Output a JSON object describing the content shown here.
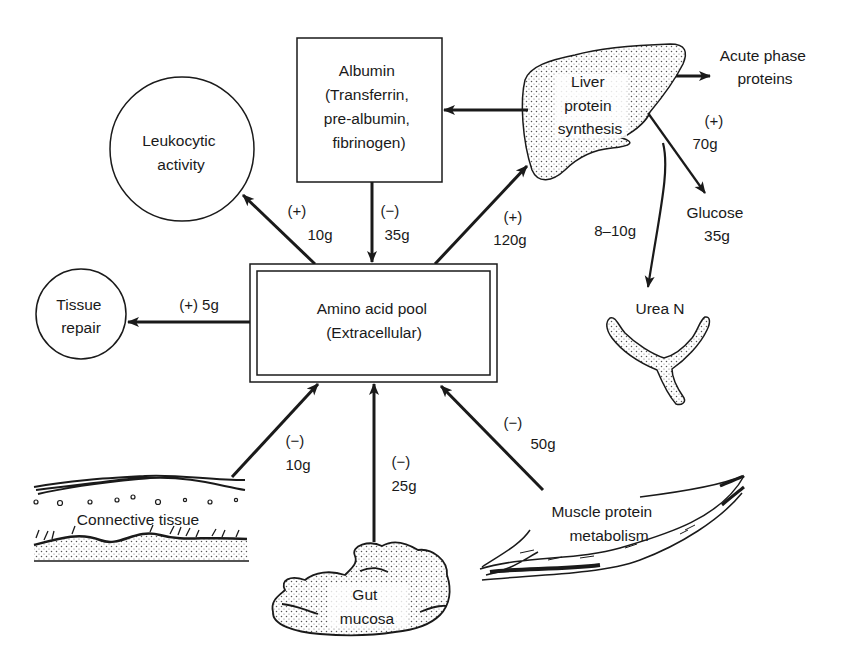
{
  "diagram": {
    "type": "protein metabolism flow diagram",
    "nodes": {
      "albumin": {
        "lines": [
          "Albumin",
          "(Transferrin,",
          "pre-albumin,",
          "fibrinogen)"
        ]
      },
      "liver": {
        "lines": [
          "Liver",
          "protein",
          "synthesis"
        ]
      },
      "acute_phase": {
        "lines": [
          "Acute phase",
          "proteins"
        ]
      },
      "leukocytic": {
        "lines": [
          "Leukocytic",
          "activity"
        ]
      },
      "tissue_repair": {
        "lines": [
          "Tissue",
          "repair"
        ]
      },
      "amino_pool": {
        "lines": [
          "Amino acid pool",
          "(Extracellular)"
        ]
      },
      "glucose": {
        "lines": [
          "Glucose",
          "35g"
        ]
      },
      "urea": {
        "lines": [
          "Urea N"
        ]
      },
      "connective": {
        "lines": [
          "Connective tissue"
        ]
      },
      "gut": {
        "lines": [
          "Gut",
          "mucosa"
        ]
      },
      "muscle": {
        "lines": [
          "Muscle protein",
          "metabolism"
        ]
      }
    },
    "flows": {
      "pool_to_leukocytic": {
        "sign": "(+)",
        "amount": "10g"
      },
      "albumin_to_pool": {
        "sign": "(−)",
        "amount": "35g"
      },
      "pool_to_liver": {
        "sign": "(+)",
        "amount": "120g"
      },
      "pool_to_tissue_repair": {
        "label": "(+) 5g"
      },
      "liver_to_glucose": {
        "sign": "(+)",
        "amount": "70g"
      },
      "liver_to_urea": {
        "amount": "8–10g"
      },
      "connective_to_pool": {
        "sign": "(−)",
        "amount": "10g"
      },
      "gut_to_pool": {
        "sign": "(−)",
        "amount": "25g"
      },
      "muscle_to_pool": {
        "sign": "(−)",
        "amount": "50g"
      }
    }
  },
  "colors": {
    "ink": "#1a1a1a",
    "stipple": "#555555",
    "background": "#ffffff"
  }
}
